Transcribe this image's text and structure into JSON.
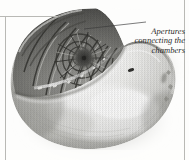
{
  "figure": {
    "kind": "halftone-photograph",
    "palette": {
      "background": "#fdfdfc",
      "rule": "#b9b9b5",
      "ink_dark": "#2b2b2b",
      "shell_shadow": "#4a4a4a",
      "shell_mid": "#8f8f8c",
      "shell_light": "#e8e8e6",
      "septa_dark": "#3a3a3a",
      "highlight": "#ffffff"
    },
    "annotation": {
      "lines": [
        "Apertures",
        "connecting the",
        "chambers"
      ],
      "align": "right",
      "style": "italic-serif",
      "leader_line": {
        "from_x": 84,
        "from_y": 29,
        "to_x": 146,
        "to_y": 22,
        "color": "#3a3a3a"
      }
    },
    "rules": [
      {
        "name": "rule-top",
        "x": 0,
        "y": 16,
        "w": 58,
        "h": 1
      },
      {
        "name": "rule-left",
        "x": 5,
        "y": 16,
        "w": 1,
        "h": 144
      },
      {
        "name": "rule-right",
        "x": 184,
        "y": 0,
        "w": 1,
        "h": 160
      }
    ],
    "spiral": {
      "center_x": 84,
      "center_y": 58,
      "description": "logarithmic spiral of chambers divided by septa, aperture openings along inner curve"
    }
  }
}
